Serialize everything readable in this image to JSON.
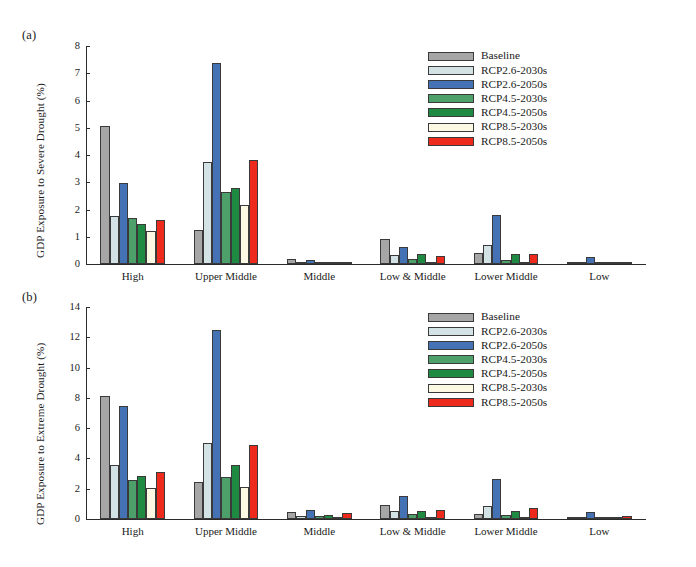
{
  "figure": {
    "panel_a_tag": "(a)",
    "panel_b_tag": "(b)"
  },
  "legend": {
    "entries": [
      {
        "label": "Baseline",
        "color": "#a6a6a6"
      },
      {
        "label": "RCP2.6-2030s",
        "color": "#d3e3e5"
      },
      {
        "label": "RCP2.6-2050s",
        "color": "#4472b4"
      },
      {
        "label": "RCP4.5-2030s",
        "color": "#4ea06a"
      },
      {
        "label": "RCP4.5-2050s",
        "color": "#1f8a41"
      },
      {
        "label": "RCP8.5-2030s",
        "color": "#fbf8e4"
      },
      {
        "label": "RCP8.5-2050s",
        "color": "#ee2a1c"
      }
    ]
  },
  "chart_data": [
    {
      "type": "bar",
      "panel": "(a)",
      "title": "",
      "xlabel": "",
      "ylabel": "GDP Exposure to Severe Drought (%)",
      "ylim": [
        0,
        8
      ],
      "yticks": [
        0,
        1,
        2,
        3,
        4,
        5,
        6,
        7,
        8
      ],
      "ytick_labels": [
        "0",
        "1",
        "2",
        "3",
        "4",
        "5",
        "6",
        "7",
        "8"
      ],
      "grid": false,
      "legend_position": "top-right",
      "categories": [
        "High",
        "Upper Middle",
        "Middle",
        "Low & Middle",
        "Lower Middle",
        "Low"
      ],
      "series": [
        {
          "name": "Baseline",
          "color": "#a6a6a6",
          "values": [
            5.07,
            1.25,
            0.18,
            0.93,
            0.41,
            0.02
          ]
        },
        {
          "name": "RCP2.6-2030s",
          "color": "#d3e3e5",
          "values": [
            1.78,
            3.74,
            0.05,
            0.33,
            0.68,
            0.02
          ]
        },
        {
          "name": "RCP2.6-2050s",
          "color": "#4472b4",
          "values": [
            2.98,
            7.36,
            0.14,
            0.63,
            1.81,
            0.24
          ]
        },
        {
          "name": "RCP4.5-2030s",
          "color": "#4ea06a",
          "values": [
            1.69,
            2.65,
            0.07,
            0.18,
            0.14,
            0.02
          ]
        },
        {
          "name": "RCP4.5-2050s",
          "color": "#1f8a41",
          "values": [
            1.47,
            2.8,
            0.05,
            0.36,
            0.35,
            0.02
          ]
        },
        {
          "name": "RCP8.5-2030s",
          "color": "#fbf8e4",
          "values": [
            1.21,
            2.15,
            0.02,
            0.06,
            0.05,
            0.01
          ]
        },
        {
          "name": "RCP8.5-2050s",
          "color": "#ee2a1c",
          "values": [
            1.61,
            3.8,
            0.06,
            0.31,
            0.38,
            0.09
          ]
        }
      ]
    },
    {
      "type": "bar",
      "panel": "(b)",
      "title": "",
      "xlabel": "",
      "ylabel": "GDP Exposure to Extreme Drought (%)",
      "ylim": [
        0,
        14
      ],
      "yticks": [
        0,
        2,
        4,
        6,
        8,
        10,
        12,
        14
      ],
      "ytick_labels": [
        "0",
        "2",
        "4",
        "6",
        "8",
        "10",
        "12",
        "14"
      ],
      "grid": false,
      "legend_position": "top-right",
      "categories": [
        "High",
        "Upper Middle",
        "Middle",
        "Low & Middle",
        "Lower Middle",
        "Low"
      ],
      "series": [
        {
          "name": "Baseline",
          "color": "#a6a6a6",
          "values": [
            8.1,
            2.45,
            0.44,
            0.93,
            0.32,
            0.03
          ]
        },
        {
          "name": "RCP2.6-2030s",
          "color": "#d3e3e5",
          "values": [
            3.55,
            5.0,
            0.18,
            0.55,
            0.85,
            0.04
          ]
        },
        {
          "name": "RCP2.6-2050s",
          "color": "#4472b4",
          "values": [
            7.45,
            12.45,
            0.62,
            1.5,
            2.65,
            0.46
          ]
        },
        {
          "name": "RCP4.5-2030s",
          "color": "#4ea06a",
          "values": [
            2.55,
            2.75,
            0.22,
            0.3,
            0.28,
            0.06
          ]
        },
        {
          "name": "RCP4.5-2050s",
          "color": "#1f8a41",
          "values": [
            2.85,
            3.55,
            0.26,
            0.52,
            0.5,
            0.06
          ]
        },
        {
          "name": "RCP8.5-2030s",
          "color": "#fbf8e4",
          "values": [
            2.05,
            2.1,
            0.07,
            0.15,
            0.12,
            0.02
          ]
        },
        {
          "name": "RCP8.5-2050s",
          "color": "#ee2a1c",
          "values": [
            3.1,
            4.9,
            0.4,
            0.62,
            0.72,
            0.22
          ]
        }
      ]
    }
  ],
  "caption": ""
}
